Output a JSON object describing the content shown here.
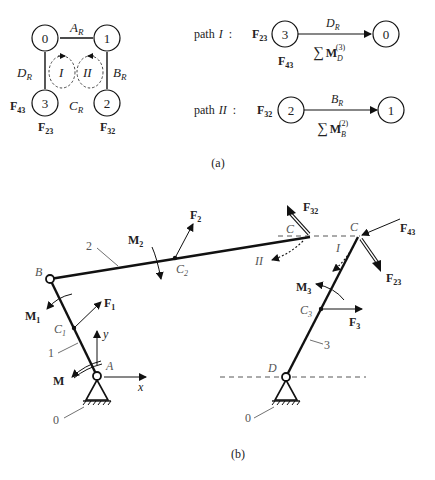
{
  "panel_a": {
    "label": "(a)",
    "graph": {
      "nodes": [
        {
          "id": "0",
          "label": "0"
        },
        {
          "id": "1",
          "label": "1"
        },
        {
          "id": "2",
          "label": "2"
        },
        {
          "id": "3",
          "label": "3"
        }
      ],
      "edges": [
        {
          "from": "0",
          "to": "1",
          "label": "A",
          "sub": "R"
        },
        {
          "from": "1",
          "to": "2",
          "label": "B",
          "sub": "R"
        },
        {
          "from": "2",
          "to": "3",
          "label": "C",
          "sub": "R"
        },
        {
          "from": "3",
          "to": "0",
          "label": "D",
          "sub": "R"
        }
      ],
      "loops": [
        {
          "label": "I"
        },
        {
          "label": "II"
        }
      ],
      "forces": [
        {
          "label": "F",
          "sub": "43"
        },
        {
          "label": "F",
          "sub": "23"
        },
        {
          "label": "F",
          "sub": "32"
        }
      ]
    },
    "paths": [
      {
        "name": "path",
        "roman": "I",
        "colon": ":",
        "force_left": {
          "label": "F",
          "sub": "23"
        },
        "force_below": {
          "label": "F",
          "sub": "43"
        },
        "from": "3",
        "to": "0",
        "joint": {
          "label": "D",
          "sub": "R"
        },
        "moment": {
          "sum": "∑",
          "label": "M",
          "sub": "D",
          "sup": "(3)"
        }
      },
      {
        "name": "path",
        "roman": "II",
        "colon": ":",
        "force_left": {
          "label": "F",
          "sub": "32"
        },
        "from": "2",
        "to": "1",
        "joint": {
          "label": "B",
          "sub": "R"
        },
        "moment": {
          "sum": "∑",
          "label": "M",
          "sub": "B",
          "sup": "(2)"
        }
      }
    ]
  },
  "panel_b": {
    "label": "(b)",
    "joints": {
      "A": "A",
      "B": "B",
      "C": "C",
      "D": "D"
    },
    "links": {
      "ground": "0",
      "l1": "1",
      "l2": "2",
      "l3": "3"
    },
    "centers": {
      "c1": "C",
      "c1_sub": "1",
      "c2": "C",
      "c2_sub": "2",
      "c3": "C",
      "c3_sub": "3"
    },
    "forces": {
      "F1": {
        "label": "F",
        "sub": "1"
      },
      "F2": {
        "label": "F",
        "sub": "2"
      },
      "F3": {
        "label": "F",
        "sub": "3"
      },
      "F32": {
        "label": "F",
        "sub": "32"
      },
      "F23": {
        "label": "F",
        "sub": "23"
      },
      "F43": {
        "label": "F",
        "sub": "43"
      }
    },
    "moments": {
      "M": {
        "label": "M"
      },
      "M1": {
        "label": "M",
        "sub": "1"
      },
      "M2": {
        "label": "M",
        "sub": "2"
      },
      "M3": {
        "label": "M",
        "sub": "3"
      }
    },
    "axes": {
      "x": "x",
      "y": "y"
    },
    "loops": {
      "I": "I",
      "II": "II"
    }
  }
}
